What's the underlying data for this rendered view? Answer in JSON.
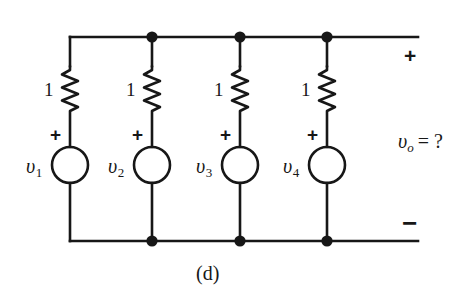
{
  "figure": {
    "caption": "(d)",
    "type": "circuit-schematic",
    "background_color": "#ffffff",
    "ink_color": "#171717"
  },
  "output": {
    "plus_label": "+",
    "minus_label": "−",
    "expression_v": "υ",
    "expression_sub": "o",
    "expression_eq": "= ?"
  },
  "branches": [
    {
      "resistor_label": "1",
      "polarity_label": "+",
      "source_label": "υ",
      "source_sub": "1",
      "x": 70
    },
    {
      "resistor_label": "1",
      "polarity_label": "+",
      "source_label": "υ",
      "source_sub": "2",
      "x": 152
    },
    {
      "resistor_label": "1",
      "polarity_label": "+",
      "source_label": "υ",
      "source_sub": "3",
      "x": 240
    },
    {
      "resistor_label": "1",
      "polarity_label": "+",
      "source_label": "υ",
      "source_sub": "4",
      "x": 327
    }
  ],
  "geometry": {
    "top_rail_y": 37,
    "bottom_rail_y": 241,
    "rail_right_x": 418,
    "source_center_y": 165,
    "source_radius": 18,
    "resistor_top_y": 66,
    "resistor_bottom_y": 111
  }
}
